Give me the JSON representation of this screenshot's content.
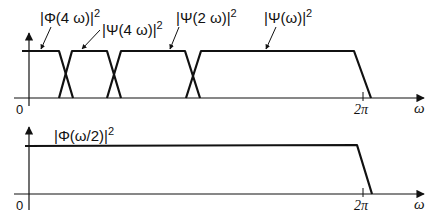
{
  "diagram": {
    "top_plot": {
      "origin_label": "0",
      "x_axis_label": "ω",
      "tick_label": "2π",
      "curve_labels": [
        {
          "id": "phi4",
          "text": "|Φ(4ω)|²",
          "base": "|Φ(4 ω)|",
          "sup": "2"
        },
        {
          "id": "psi4",
          "text": "|Ψ(4ω)|²",
          "base": "|Ψ(4 ω)|",
          "sup": "2"
        },
        {
          "id": "psi2",
          "text": "|Ψ(2ω)|²",
          "base": "|Ψ(2 ω)|",
          "sup": "2"
        },
        {
          "id": "psi1",
          "text": "|Ψ(ω)|²",
          "base": "|Ψ(ω)|",
          "sup": "2"
        }
      ]
    },
    "bottom_plot": {
      "origin_label": "0",
      "x_axis_label": "ω",
      "tick_label": "2π",
      "curve_labels": [
        {
          "id": "phi_half",
          "text": "|Φ(ω/2)|²",
          "base": "|Φ(ω/2)|",
          "sup": "2"
        }
      ]
    },
    "colors": {
      "stroke": "#111111",
      "background": "#ffffff"
    }
  }
}
